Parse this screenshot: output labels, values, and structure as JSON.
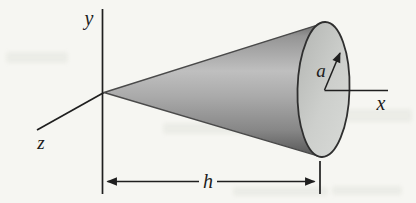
{
  "figure": {
    "type": "cone-geometry-diagram",
    "labels": {
      "y_axis": "y",
      "z_axis": "z",
      "x_axis": "x",
      "radius": "a",
      "height": "h"
    },
    "colors": {
      "background": "#f6f6f2",
      "line": "#1f1f1f",
      "cone_outline": "#2f2f2f",
      "cone_surface_shadow_top": "#666666",
      "cone_surface_highlight": "#bfbfbf",
      "cone_surface_shadow_bottom": "#565656",
      "cone_base_dark": "#b3b5b2",
      "cone_base_light": "#d8dad7"
    }
  }
}
